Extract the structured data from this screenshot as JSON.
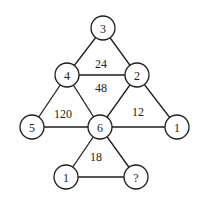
{
  "diagram": {
    "type": "number-triangle-puzzle",
    "nodes": [
      {
        "id": "n_top",
        "label": "3",
        "x": 103,
        "y": 28
      },
      {
        "id": "n_midleft",
        "label": "4",
        "x": 67,
        "y": 75
      },
      {
        "id": "n_midright",
        "label": "2",
        "x": 137,
        "y": 75
      },
      {
        "id": "n_left",
        "label": "5",
        "x": 32,
        "y": 127
      },
      {
        "id": "n_center",
        "label": "6",
        "x": 100,
        "y": 127
      },
      {
        "id": "n_right",
        "label": "1",
        "x": 177,
        "y": 127
      },
      {
        "id": "n_botleft",
        "label": "1",
        "x": 66,
        "y": 177
      },
      {
        "id": "n_botright",
        "label": "?",
        "x": 136,
        "y": 177
      }
    ],
    "edges": [
      [
        "n_top",
        "n_midleft"
      ],
      [
        "n_top",
        "n_midright"
      ],
      [
        "n_midleft",
        "n_midright"
      ],
      [
        "n_midleft",
        "n_left"
      ],
      [
        "n_midleft",
        "n_center"
      ],
      [
        "n_left",
        "n_center"
      ],
      [
        "n_midright",
        "n_center"
      ],
      [
        "n_midright",
        "n_right"
      ],
      [
        "n_center",
        "n_right"
      ],
      [
        "n_center",
        "n_botleft"
      ],
      [
        "n_center",
        "n_botright"
      ],
      [
        "n_botleft",
        "n_botright"
      ]
    ],
    "face_labels": [
      {
        "id": "f_top",
        "label": "24",
        "x": 101,
        "y": 64
      },
      {
        "id": "f_middle",
        "label": "48",
        "x": 101,
        "y": 88
      },
      {
        "id": "f_left",
        "label": "120",
        "x": 63,
        "y": 114
      },
      {
        "id": "f_right",
        "label": "12",
        "x": 138,
        "y": 112
      },
      {
        "id": "f_bottom",
        "label": "18",
        "x": 96,
        "y": 157
      }
    ],
    "node_radius": 12,
    "unknown": "?"
  }
}
